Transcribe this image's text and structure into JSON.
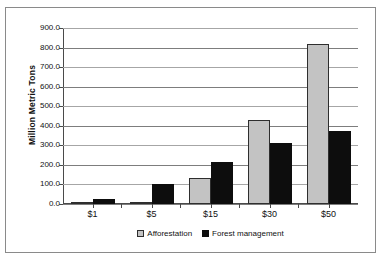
{
  "chart_data": {
    "type": "bar",
    "title": "",
    "subtitle": "",
    "xlabel": "",
    "ylabel": "Million Metric Tons",
    "categories": [
      "$1",
      "$5",
      "$15",
      "$30",
      "$50"
    ],
    "series": [
      {
        "name": "Afforestation",
        "color": "#c3c3c3",
        "values": [
          0,
          3,
          135,
          430,
          820
        ]
      },
      {
        "name": "Forest management",
        "color": "#0d0d0d",
        "values": [
          25,
          100,
          215,
          310,
          375
        ]
      }
    ],
    "ylim": [
      0,
      900
    ],
    "ytick_values": [
      0,
      100,
      200,
      300,
      400,
      500,
      600,
      700,
      800,
      900
    ],
    "ytick_labels": [
      "0.0",
      "100.0",
      "200.0",
      "300.0",
      "400.0",
      "500.0",
      "600.0",
      "700.0",
      "800.0",
      "900.0"
    ],
    "grid": true,
    "grid_axis": "y",
    "legend_position": "bottom",
    "legend_entries": [
      "Afforestation",
      "Forest management"
    ]
  }
}
